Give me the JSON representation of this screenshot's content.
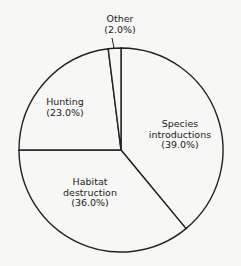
{
  "chart_data": {
    "type": "pie",
    "title": "",
    "start_angle": "12 o'clock",
    "direction": "clockwise",
    "slices": [
      {
        "label": "Species introductions",
        "label_lines": [
          "Species",
          "introductions",
          "(39.0%)"
        ],
        "value": 39.0
      },
      {
        "label": "Habitat destruction",
        "label_lines": [
          "Habitat",
          "destruction",
          "(36.0%)"
        ],
        "value": 36.0
      },
      {
        "label": "Hunting",
        "label_lines": [
          "Hunting",
          "(23.0%)"
        ],
        "value": 23.0
      },
      {
        "label": "Other",
        "label_lines": [
          "Other",
          "(2.0%)"
        ],
        "value": 2.0
      }
    ],
    "fill_color": "#f7f7f5",
    "stroke_color": "#222222"
  }
}
